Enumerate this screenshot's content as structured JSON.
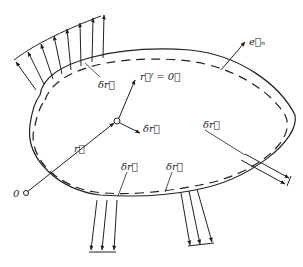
{
  "diagram": {
    "type": "mechanics-virtual-displacement",
    "colors": {
      "ink": "#222222",
      "background": "#ffffff"
    },
    "labels": {
      "origin": "0",
      "position_vector": "r⃗",
      "rf_zero": "r⃗ᶠ = 0⃗",
      "normal": "e⃗ₙ",
      "dr_top_left": "δr⃗",
      "dr_center": "δr⃗",
      "dr_right": "δr⃗",
      "dr_bottom_left": "δr⃗",
      "dr_bottom_mid": "δr⃗"
    },
    "elements": [
      "solid-contour",
      "dashed-displaced-contour",
      "distributed-load-top-left",
      "distributed-load-bottom-left",
      "distributed-load-bottom-right",
      "distributed-load-right",
      "position-vector-r",
      "normal-vector-en",
      "virtual-displacement-vectors"
    ]
  }
}
